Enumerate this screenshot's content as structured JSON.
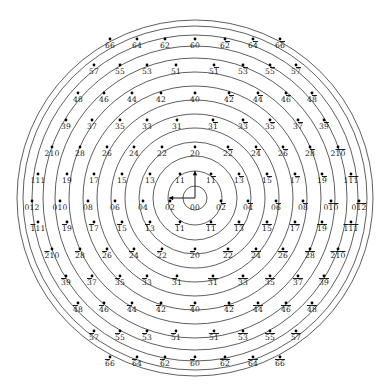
{
  "figure": {
    "type": "lattice-arc-diagram",
    "background": "#ffffff",
    "stroke_color": "#2a2a2a",
    "node_color": "#000000",
    "center_label": "00",
    "origin": {
      "x": 195,
      "y": 198
    },
    "arrows": [
      {
        "name": "basis-vector-up",
        "label": "",
        "dx": 0,
        "dy": -27
      },
      {
        "name": "basis-vector-left",
        "label": "",
        "dx": -26,
        "dy": 0
      }
    ],
    "top_strip_fragments": [
      "",
      "",
      "",
      "",
      "",
      "",
      "",
      "",
      "",
      "",
      "",
      ""
    ]
  },
  "chart_data": {
    "type": "scatter",
    "title": "",
    "xlabel": "",
    "ylabel": "",
    "grid": false,
    "legend": null,
    "radii": [
      12,
      27,
      42,
      56,
      70,
      84,
      98,
      112,
      126,
      140,
      152,
      163,
      172,
      178
    ],
    "rows": [
      {
        "row": 1,
        "ring": 13,
        "y": 46,
        "labels": [
          "66",
          "64",
          "62",
          "60",
          "6-2",
          "6-4",
          "6-6"
        ],
        "display": [
          "66",
          "64",
          "62",
          "60",
          "62",
          "64",
          "66"
        ],
        "overbar_second": [
          false,
          false,
          false,
          false,
          true,
          true,
          true
        ],
        "overbar_first": [
          false,
          false,
          false,
          false,
          false,
          false,
          false
        ],
        "xs": [
          110,
          137,
          165,
          195,
          225,
          253,
          280
        ]
      },
      {
        "row": 2,
        "ring": 12,
        "y": 72,
        "labels": [
          "57",
          "55",
          "53",
          "51",
          "5-1",
          "5-3",
          "5-5",
          "5-7"
        ],
        "display": [
          "57",
          "55",
          "53",
          "51",
          "51",
          "53",
          "55",
          "57"
        ],
        "overbar_second": [
          false,
          false,
          false,
          false,
          true,
          true,
          true,
          true
        ],
        "overbar_first": [
          false,
          false,
          false,
          false,
          false,
          false,
          false,
          false
        ],
        "xs": [
          94,
          120,
          147,
          176,
          214,
          243,
          270,
          296
        ]
      },
      {
        "row": 3,
        "ring": 11,
        "y": 100,
        "labels": [
          "48",
          "46",
          "44",
          "42",
          "40",
          "4-2",
          "4-4",
          "4-6",
          "4-8"
        ],
        "display": [
          "48",
          "46",
          "44",
          "42",
          "40",
          "42",
          "44",
          "46",
          "48"
        ],
        "overbar_second": [
          false,
          false,
          false,
          false,
          false,
          true,
          true,
          true,
          true
        ],
        "overbar_first": [
          false,
          false,
          false,
          false,
          false,
          false,
          false,
          false,
          false
        ],
        "xs": [
          78,
          104,
          132,
          161,
          195,
          229,
          258,
          286,
          312
        ]
      },
      {
        "row": 4,
        "ring": 10,
        "y": 127,
        "labels": [
          "39",
          "37",
          "35",
          "33",
          "31",
          "3-1",
          "3-3",
          "3-5",
          "3-7",
          "3-9"
        ],
        "display": [
          "39",
          "37",
          "35",
          "33",
          "31",
          "31",
          "33",
          "35",
          "37",
          "39"
        ],
        "overbar_second": [
          false,
          false,
          false,
          false,
          false,
          true,
          true,
          true,
          true,
          true
        ],
        "overbar_first": [
          false,
          false,
          false,
          false,
          false,
          false,
          false,
          false,
          false,
          false
        ],
        "xs": [
          66,
          92,
          120,
          147,
          177,
          213,
          243,
          270,
          298,
          324
        ]
      },
      {
        "row": 5,
        "ring": 9,
        "y": 154,
        "labels": [
          "210",
          "28",
          "26",
          "24",
          "22",
          "20",
          "2-2",
          "2-4",
          "2-6",
          "2-8",
          "2-10"
        ],
        "display": [
          "210",
          "28",
          "26",
          "24",
          "22",
          "20",
          "22",
          "24",
          "26",
          "28",
          "210"
        ],
        "overbar_second": [
          false,
          false,
          false,
          false,
          false,
          false,
          true,
          true,
          true,
          true,
          true
        ],
        "overbar_first": [
          false,
          false,
          false,
          false,
          false,
          false,
          false,
          false,
          false,
          false,
          false
        ],
        "xs": [
          52,
          80,
          107,
          134,
          162,
          195,
          228,
          256,
          283,
          310,
          338
        ]
      },
      {
        "row": 6,
        "ring": 8,
        "y": 181,
        "labels": [
          "111",
          "19",
          "17",
          "15",
          "13",
          "11",
          "1-1",
          "1-3",
          "1-5",
          "1-7",
          "1-9",
          "1-11"
        ],
        "display": [
          "111",
          "19",
          "17",
          "15",
          "13",
          "11",
          "11",
          "13",
          "15",
          "17",
          "19",
          "111"
        ],
        "overbar_second": [
          false,
          false,
          false,
          false,
          false,
          false,
          true,
          true,
          true,
          true,
          true,
          true
        ],
        "overbar_first": [
          false,
          false,
          false,
          false,
          false,
          false,
          false,
          false,
          false,
          false,
          false,
          false
        ],
        "xs": [
          38,
          67,
          94,
          122,
          150,
          180,
          211,
          239,
          267,
          295,
          322,
          351
        ]
      },
      {
        "row": 7,
        "ring": 7,
        "y": 208,
        "labels": [
          "012",
          "010",
          "08",
          "06",
          "04",
          "02",
          "00",
          "0-2",
          "0-4",
          "0-6",
          "0-8",
          "0-10",
          "0-12"
        ],
        "display": [
          "012",
          "010",
          "08",
          "06",
          "04",
          "02",
          "00",
          "02",
          "04",
          "06",
          "08",
          "010",
          "012"
        ],
        "overbar_second": [
          false,
          false,
          false,
          false,
          false,
          false,
          false,
          true,
          true,
          true,
          true,
          true,
          true
        ],
        "overbar_first": [
          false,
          false,
          false,
          false,
          false,
          false,
          false,
          false,
          false,
          false,
          false,
          false,
          false
        ],
        "xs": [
          32,
          60,
          88,
          115,
          143,
          170,
          195,
          221,
          248,
          276,
          303,
          331,
          359
        ]
      },
      {
        "row": 8,
        "ring": 8,
        "y": 229,
        "labels": [
          "-111",
          "-19",
          "-17",
          "-15",
          "-13",
          "-11",
          "-1-1",
          "-1-3",
          "-1-5",
          "-1-7",
          "-1-9",
          "-1-11"
        ],
        "display": [
          "111",
          "19",
          "17",
          "15",
          "13",
          "11",
          "11",
          "13",
          "15",
          "17",
          "19",
          "111"
        ],
        "overbar_second": [
          false,
          false,
          false,
          false,
          false,
          false,
          true,
          true,
          true,
          true,
          true,
          true
        ],
        "overbar_first": [
          true,
          true,
          true,
          true,
          true,
          true,
          true,
          true,
          true,
          true,
          true,
          true
        ],
        "xs": [
          38,
          67,
          94,
          122,
          150,
          180,
          211,
          239,
          267,
          295,
          322,
          351
        ]
      },
      {
        "row": 9,
        "ring": 9,
        "y": 256,
        "labels": [
          "-210",
          "-28",
          "-26",
          "-24",
          "-22",
          "-20",
          "-2-2",
          "-2-4",
          "-2-6",
          "-2-8",
          "-2-10"
        ],
        "display": [
          "210",
          "28",
          "26",
          "24",
          "22",
          "20",
          "22",
          "24",
          "26",
          "28",
          "210"
        ],
        "overbar_second": [
          false,
          false,
          false,
          false,
          false,
          false,
          true,
          true,
          true,
          true,
          true
        ],
        "overbar_first": [
          true,
          true,
          true,
          true,
          true,
          true,
          true,
          true,
          true,
          true,
          true
        ],
        "xs": [
          52,
          80,
          107,
          134,
          162,
          195,
          228,
          256,
          283,
          310,
          338
        ]
      },
      {
        "row": 10,
        "ring": 10,
        "y": 283,
        "labels": [
          "-39",
          "-37",
          "-35",
          "-33",
          "-31",
          "-3-1",
          "-3-3",
          "-3-5",
          "-3-7",
          "-3-9"
        ],
        "display": [
          "39",
          "37",
          "35",
          "33",
          "31",
          "31",
          "33",
          "35",
          "37",
          "39"
        ],
        "overbar_second": [
          false,
          false,
          false,
          false,
          false,
          true,
          true,
          true,
          true,
          true
        ],
        "overbar_first": [
          true,
          true,
          true,
          true,
          true,
          true,
          true,
          true,
          true,
          true
        ],
        "xs": [
          66,
          92,
          120,
          147,
          177,
          213,
          243,
          270,
          298,
          324
        ]
      },
      {
        "row": 11,
        "ring": 11,
        "y": 310,
        "labels": [
          "-48",
          "-46",
          "-44",
          "-42",
          "-40",
          "-4-2",
          "-4-4",
          "-4-6",
          "-4-8"
        ],
        "display": [
          "48",
          "46",
          "44",
          "42",
          "40",
          "42",
          "44",
          "46",
          "48"
        ],
        "overbar_second": [
          false,
          false,
          false,
          false,
          false,
          true,
          true,
          true,
          true
        ],
        "overbar_first": [
          true,
          true,
          true,
          true,
          true,
          true,
          true,
          true,
          true
        ],
        "xs": [
          78,
          104,
          132,
          161,
          195,
          229,
          258,
          286,
          312
        ]
      },
      {
        "row": 12,
        "ring": 12,
        "y": 338,
        "labels": [
          "-57",
          "-55",
          "-53",
          "-51",
          "-5-1",
          "-5-3",
          "-5-5",
          "-5-7"
        ],
        "display": [
          "57",
          "55",
          "53",
          "51",
          "51",
          "53",
          "55",
          "57"
        ],
        "overbar_second": [
          false,
          false,
          false,
          false,
          true,
          true,
          true,
          true
        ],
        "overbar_first": [
          true,
          true,
          true,
          true,
          true,
          true,
          true,
          true
        ],
        "xs": [
          94,
          120,
          147,
          176,
          214,
          243,
          270,
          296
        ]
      },
      {
        "row": 13,
        "ring": 13,
        "y": 364,
        "labels": [
          "-66",
          "-64",
          "-62",
          "-60",
          "-6-2",
          "-6-4",
          "-6-6"
        ],
        "display": [
          "66",
          "64",
          "62",
          "60",
          "62",
          "64",
          "66"
        ],
        "overbar_second": [
          false,
          false,
          false,
          false,
          true,
          true,
          true
        ],
        "overbar_first": [
          true,
          true,
          true,
          true,
          true,
          true,
          true
        ],
        "xs": [
          110,
          137,
          165,
          195,
          225,
          253,
          280
        ]
      }
    ]
  }
}
